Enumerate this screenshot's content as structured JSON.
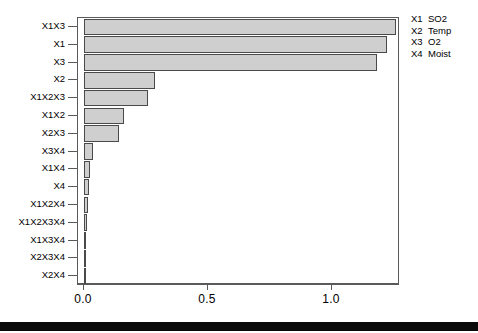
{
  "chart_data": {
    "type": "bar",
    "orientation": "horizontal",
    "title": "",
    "xlabel": "",
    "ylabel": "",
    "xlim": [
      0.0,
      1.3
    ],
    "xticks": [
      "0.0",
      "0.5",
      "1.0"
    ],
    "xtick_values": [
      0.0,
      0.5,
      1.0
    ],
    "grid": false,
    "categories": [
      "X1X3",
      "X1",
      "X3",
      "X2",
      "X1X2X3",
      "X1X2",
      "X2X3",
      "X3X4",
      "X1X4",
      "X4",
      "X1X2X4",
      "X1X2X3X4",
      "X1X3X4",
      "X2X3X4",
      "X2X4"
    ],
    "values": [
      1.26,
      1.22,
      1.18,
      0.285,
      0.26,
      0.16,
      0.14,
      0.037,
      0.025,
      0.021,
      0.018,
      0.013,
      0.008,
      0.005,
      0.002
    ],
    "bar_fill_color": "#cfcfcf",
    "bar_border_color": "#4a4a4a",
    "axis_color": "#5a5a5a",
    "legend_position": "outside-top-right",
    "legend": [
      {
        "key": "X1",
        "value": "SO2"
      },
      {
        "key": "X2",
        "value": "Temp"
      },
      {
        "key": "X3",
        "value": "O2"
      },
      {
        "key": "X4",
        "value": "Moist"
      }
    ]
  }
}
